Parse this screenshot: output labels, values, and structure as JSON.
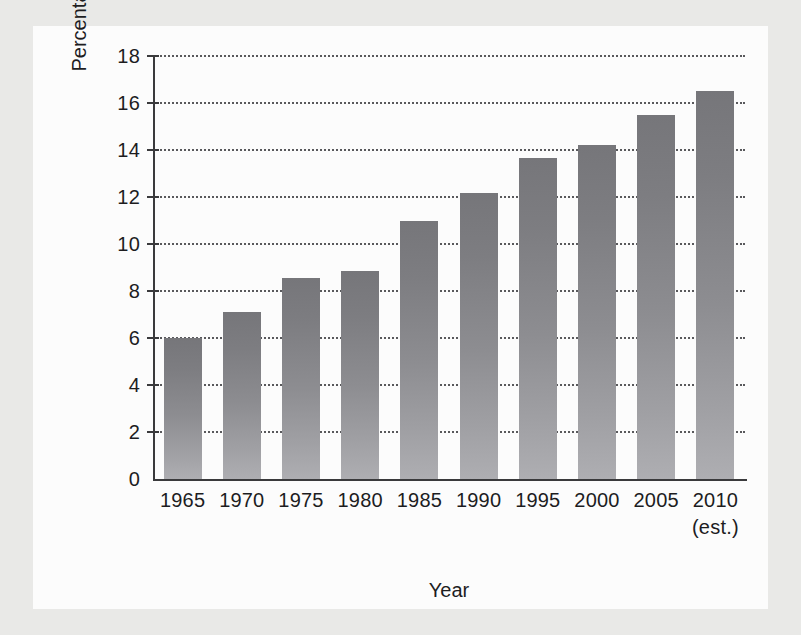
{
  "figure": {
    "background_color": "#e9e9e7",
    "plate_color": "#fcfcfc"
  },
  "chart_data": {
    "type": "bar",
    "title": "",
    "xlabel": "Year",
    "ylabel": "Percentage of Total National Income",
    "categories": [
      "1965",
      "1970",
      "1975",
      "1980",
      "1985",
      "1990",
      "1995",
      "2000",
      "2005",
      "2010"
    ],
    "category_sublabels": [
      "",
      "",
      "",
      "",
      "",
      "",
      "",
      "",
      "",
      "(est.)"
    ],
    "values": [
      6.0,
      7.1,
      8.55,
      8.85,
      11.0,
      12.15,
      13.65,
      14.2,
      15.5,
      16.5
    ],
    "ylim": [
      0,
      18
    ],
    "ytick_values": [
      0,
      2,
      4,
      6,
      8,
      10,
      12,
      14,
      16,
      18
    ],
    "ytick_labels": [
      "0",
      "2",
      "4",
      "6",
      "8",
      "10",
      "12",
      "14",
      "16",
      "18"
    ],
    "grid": true,
    "grid_style": "dotted",
    "grid_color": "#59595c",
    "legend": "none",
    "bar_color_top": "#76767a",
    "bar_color_bottom": "#aeaeb2",
    "axis_color": "#3a3a3c"
  }
}
